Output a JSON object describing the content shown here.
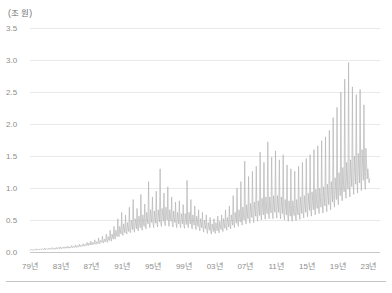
{
  "chart_data": {
    "type": "line",
    "title": "",
    "subtitle": "",
    "unit_label": "(조 원)",
    "xlabel": "",
    "ylabel": "",
    "ylim": [
      0.0,
      3.5
    ],
    "yticks": [
      "0.0",
      "0.5",
      "1.0",
      "1.5",
      "2.0",
      "2.5",
      "3.0",
      "3.5"
    ],
    "ytick_values": [
      0.0,
      0.5,
      1.0,
      1.5,
      2.0,
      2.5,
      3.0,
      3.5
    ],
    "xticks": [
      "79년",
      "83년",
      "87년",
      "91년",
      "95년",
      "99년",
      "03년",
      "07년",
      "11년",
      "15년",
      "19년",
      "23년"
    ],
    "xtick_values": [
      1979,
      1983,
      1987,
      1991,
      1995,
      1999,
      2003,
      2007,
      2011,
      2015,
      2019,
      2023
    ],
    "xlim": [
      1979,
      2024.5
    ],
    "grid": true,
    "legend": null,
    "line_color": "#b5b5b5",
    "grid_color": "#e9e9e9",
    "axis_color": "#c8c8c8",
    "text_color": "#8d8d8d",
    "frequency": "monthly",
    "x_start": 1979.0,
    "x_step": 0.08333,
    "series": [
      {
        "name": "월별 값",
        "values": [
          0.03,
          0.03,
          0.04,
          0.03,
          0.03,
          0.04,
          0.03,
          0.03,
          0.04,
          0.04,
          0.03,
          0.05,
          0.04,
          0.03,
          0.04,
          0.04,
          0.04,
          0.05,
          0.04,
          0.04,
          0.05,
          0.04,
          0.04,
          0.06,
          0.04,
          0.04,
          0.05,
          0.05,
          0.04,
          0.06,
          0.05,
          0.04,
          0.06,
          0.05,
          0.05,
          0.07,
          0.05,
          0.04,
          0.06,
          0.05,
          0.05,
          0.07,
          0.05,
          0.05,
          0.07,
          0.06,
          0.05,
          0.08,
          0.06,
          0.05,
          0.07,
          0.06,
          0.06,
          0.08,
          0.06,
          0.06,
          0.08,
          0.07,
          0.06,
          0.09,
          0.07,
          0.06,
          0.08,
          0.07,
          0.07,
          0.1,
          0.07,
          0.07,
          0.09,
          0.08,
          0.07,
          0.11,
          0.08,
          0.07,
          0.1,
          0.09,
          0.08,
          0.12,
          0.09,
          0.08,
          0.11,
          0.1,
          0.09,
          0.13,
          0.1,
          0.09,
          0.12,
          0.11,
          0.1,
          0.15,
          0.11,
          0.1,
          0.14,
          0.12,
          0.11,
          0.17,
          0.12,
          0.11,
          0.15,
          0.13,
          0.12,
          0.19,
          0.13,
          0.12,
          0.16,
          0.15,
          0.13,
          0.22,
          0.14,
          0.13,
          0.18,
          0.16,
          0.15,
          0.25,
          0.16,
          0.14,
          0.2,
          0.18,
          0.16,
          0.28,
          0.18,
          0.15,
          0.24,
          0.2,
          0.18,
          0.34,
          0.2,
          0.17,
          0.28,
          0.23,
          0.2,
          0.4,
          0.24,
          0.2,
          0.34,
          0.28,
          0.24,
          0.52,
          0.28,
          0.24,
          0.4,
          0.33,
          0.28,
          0.62,
          0.3,
          0.26,
          0.44,
          0.36,
          0.3,
          0.58,
          0.32,
          0.28,
          0.46,
          0.38,
          0.32,
          0.7,
          0.34,
          0.3,
          0.5,
          0.42,
          0.35,
          0.82,
          0.36,
          0.31,
          0.52,
          0.44,
          0.36,
          0.68,
          0.38,
          0.33,
          0.56,
          0.46,
          0.38,
          0.9,
          0.4,
          0.34,
          0.58,
          0.48,
          0.4,
          0.75,
          0.42,
          0.36,
          0.62,
          0.52,
          0.44,
          1.1,
          0.46,
          0.38,
          0.66,
          0.55,
          0.46,
          0.86,
          0.44,
          0.38,
          0.64,
          0.54,
          0.45,
          0.95,
          0.45,
          0.39,
          0.66,
          0.56,
          0.47,
          1.3,
          0.46,
          0.4,
          0.68,
          0.58,
          0.48,
          0.92,
          0.47,
          0.41,
          0.7,
          0.6,
          0.5,
          1.02,
          0.46,
          0.4,
          0.66,
          0.56,
          0.48,
          0.86,
          0.45,
          0.39,
          0.64,
          0.54,
          0.46,
          0.78,
          0.44,
          0.38,
          0.62,
          0.52,
          0.44,
          0.8,
          0.43,
          0.38,
          0.6,
          0.52,
          0.44,
          0.74,
          0.42,
          0.37,
          0.6,
          0.52,
          0.43,
          1.12,
          0.44,
          0.38,
          0.62,
          0.53,
          0.44,
          0.82,
          0.42,
          0.36,
          0.58,
          0.5,
          0.42,
          0.72,
          0.4,
          0.35,
          0.56,
          0.48,
          0.4,
          0.66,
          0.38,
          0.33,
          0.52,
          0.45,
          0.38,
          0.62,
          0.36,
          0.31,
          0.5,
          0.43,
          0.36,
          0.58,
          0.33,
          0.29,
          0.46,
          0.4,
          0.34,
          0.54,
          0.32,
          0.28,
          0.44,
          0.38,
          0.32,
          0.52,
          0.34,
          0.29,
          0.46,
          0.4,
          0.33,
          0.56,
          0.35,
          0.3,
          0.48,
          0.41,
          0.35,
          0.58,
          0.38,
          0.32,
          0.52,
          0.44,
          0.37,
          0.66,
          0.4,
          0.34,
          0.54,
          0.46,
          0.39,
          0.72,
          0.42,
          0.36,
          0.58,
          0.5,
          0.42,
          0.88,
          0.46,
          0.38,
          0.62,
          0.53,
          0.45,
          1.0,
          0.48,
          0.4,
          0.66,
          0.56,
          0.47,
          1.1,
          0.5,
          0.42,
          0.7,
          0.6,
          0.5,
          1.42,
          0.52,
          0.44,
          0.74,
          0.62,
          0.52,
          1.18,
          0.54,
          0.45,
          0.76,
          0.64,
          0.54,
          1.26,
          0.56,
          0.46,
          0.78,
          0.66,
          0.56,
          1.34,
          0.58,
          0.48,
          0.8,
          0.68,
          0.57,
          1.56,
          0.6,
          0.5,
          0.84,
          0.7,
          0.58,
          1.4,
          0.62,
          0.51,
          0.86,
          0.72,
          0.6,
          1.72,
          0.62,
          0.52,
          0.86,
          0.73,
          0.61,
          1.48,
          0.63,
          0.52,
          0.88,
          0.74,
          0.62,
          1.58,
          0.64,
          0.53,
          0.88,
          0.75,
          0.62,
          1.44,
          0.62,
          0.52,
          0.86,
          0.72,
          0.6,
          1.52,
          0.6,
          0.5,
          0.82,
          0.7,
          0.58,
          1.36,
          0.58,
          0.48,
          0.8,
          0.68,
          0.56,
          1.3,
          0.58,
          0.48,
          0.8,
          0.68,
          0.57,
          1.26,
          0.59,
          0.49,
          0.82,
          0.7,
          0.58,
          1.34,
          0.62,
          0.51,
          0.86,
          0.72,
          0.6,
          1.4,
          0.64,
          0.53,
          0.88,
          0.74,
          0.62,
          1.46,
          0.66,
          0.55,
          0.92,
          0.78,
          0.65,
          1.52,
          0.68,
          0.56,
          0.94,
          0.8,
          0.66,
          1.6,
          0.7,
          0.58,
          0.98,
          0.82,
          0.68,
          1.66,
          0.72,
          0.6,
          1.0,
          0.85,
          0.7,
          1.74,
          0.74,
          0.61,
          1.02,
          0.87,
          0.72,
          1.8,
          0.76,
          0.63,
          1.06,
          0.9,
          0.74,
          1.9,
          0.8,
          0.66,
          1.1,
          0.94,
          0.78,
          2.1,
          0.84,
          0.7,
          1.16,
          0.98,
          0.82,
          2.26,
          0.9,
          0.74,
          1.24,
          1.05,
          0.88,
          2.5,
          0.96,
          0.8,
          1.32,
          1.12,
          0.94,
          2.7,
          1.0,
          0.84,
          1.4,
          1.18,
          0.98,
          2.96,
          1.05,
          0.86,
          1.44,
          1.22,
          1.02,
          2.58,
          1.08,
          0.9,
          1.5,
          1.28,
          1.06,
          2.46,
          1.12,
          0.92,
          1.54,
          1.3,
          1.08,
          2.54,
          1.16,
          0.96,
          1.6,
          1.36,
          1.12,
          2.3,
          1.18,
          0.98,
          1.62,
          1.38,
          1.14,
          1.3,
          1.2,
          1.08,
          1.14
        ]
      }
    ]
  }
}
